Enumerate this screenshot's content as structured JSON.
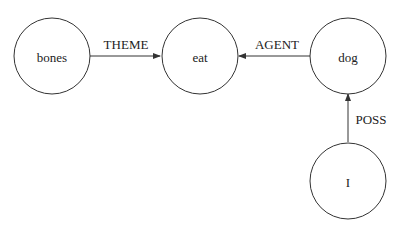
{
  "diagram": {
    "nodes": [
      {
        "id": "bones",
        "label": "bones"
      },
      {
        "id": "eat",
        "label": "eat"
      },
      {
        "id": "dog",
        "label": "dog"
      },
      {
        "id": "I",
        "label": "I"
      }
    ],
    "edges": [
      {
        "from": "bones",
        "to": "eat",
        "label": "THEME"
      },
      {
        "from": "dog",
        "to": "eat",
        "label": "AGENT"
      },
      {
        "from": "I",
        "to": "dog",
        "label": "POSS"
      }
    ]
  }
}
